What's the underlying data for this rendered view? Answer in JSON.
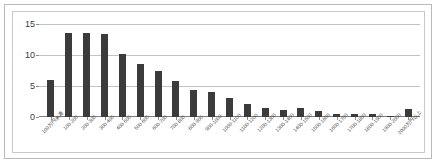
{
  "chart_data": {
    "type": "bar",
    "title": "",
    "subtitle": "",
    "xlabel": "",
    "ylabel": "",
    "ylim": [
      0,
      15
    ],
    "yticks": [
      0,
      5,
      10,
      15
    ],
    "grid": true,
    "legend": false,
    "bar_color": "#3b3b3b",
    "grid_color": "#c2c2c2",
    "categories": [
      "100万円未満",
      "100-200",
      "200-300",
      "300-400",
      "400-500",
      "500-600",
      "600-700",
      "700-800",
      "800-900",
      "900-1000",
      "1000-1100",
      "1100-1200",
      "1200-1300",
      "1300-1400",
      "1400-1500",
      "1500-1600",
      "1600-1700",
      "1700-1800",
      "1800-1900",
      "1900-2000",
      "2000万円以上"
    ],
    "values": [
      6,
      13.5,
      13.5,
      13.4,
      10.1,
      8.5,
      7.5,
      5.8,
      4.4,
      4.1,
      3.0,
      2.1,
      1.4,
      1.1,
      1.4,
      1.0,
      0.5,
      0.5,
      0.5,
      0.2,
      1.3
    ]
  }
}
